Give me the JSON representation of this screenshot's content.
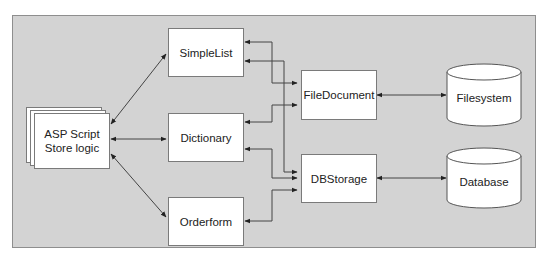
{
  "diagram": {
    "title": "",
    "colors": {
      "background": "#d3d3d3",
      "box_fill": "#ffffff",
      "line": "#333333"
    },
    "nodes": {
      "asp": {
        "label_line1": "ASP Script",
        "label_line2": "Store logic",
        "shape": "stacked-documents"
      },
      "simplelist": {
        "label": "SimpleList",
        "shape": "rectangle"
      },
      "dictionary": {
        "label": "Dictionary",
        "shape": "rectangle"
      },
      "orderform": {
        "label": "Orderform",
        "shape": "rectangle"
      },
      "filedocument": {
        "label": "FileDocument",
        "shape": "rectangle"
      },
      "dbstorage": {
        "label": "DBStorage",
        "shape": "rectangle"
      },
      "filesystem": {
        "label": "Filesystem",
        "shape": "cylinder"
      },
      "database": {
        "label": "Database",
        "shape": "cylinder"
      }
    },
    "edges": [
      {
        "from": "ASP Script Store logic",
        "to": "SimpleList",
        "direction": "both"
      },
      {
        "from": "ASP Script Store logic",
        "to": "Dictionary",
        "direction": "both"
      },
      {
        "from": "ASP Script Store logic",
        "to": "Orderform",
        "direction": "both"
      },
      {
        "from": "FileDocument",
        "to": "SimpleList",
        "direction": "both"
      },
      {
        "from": "FileDocument",
        "to": "Dictionary",
        "direction": "both"
      },
      {
        "from": "DBStorage",
        "to": "SimpleList",
        "direction": "both"
      },
      {
        "from": "DBStorage",
        "to": "Dictionary",
        "direction": "both"
      },
      {
        "from": "DBStorage",
        "to": "Orderform",
        "direction": "both"
      },
      {
        "from": "FileDocument",
        "to": "Filesystem",
        "direction": "both"
      },
      {
        "from": "DBStorage",
        "to": "Database",
        "direction": "both"
      }
    ]
  }
}
